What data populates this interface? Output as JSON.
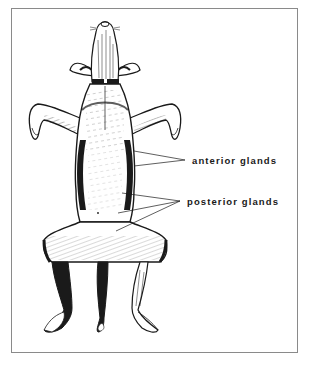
{
  "figure": {
    "labels": [
      {
        "id": "anterior",
        "text": "anterior glands",
        "leader_count": 2
      },
      {
        "id": "posterior",
        "text": "posterior glands",
        "leader_count": 3
      }
    ],
    "colors": {
      "ink": "#1a1a1a",
      "frame": "#8a8a8a",
      "background": "#ffffff"
    }
  }
}
